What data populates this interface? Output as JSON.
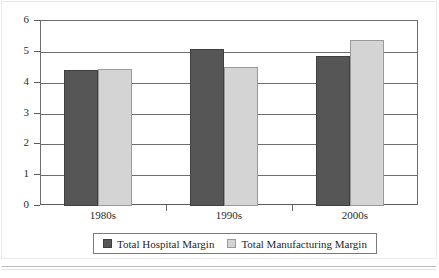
{
  "chart_data": {
    "type": "bar",
    "title": "",
    "subtitle": "",
    "xlabel": "",
    "ylabel": "",
    "categories": [
      "1980s",
      "1990s",
      "2000s"
    ],
    "series": [
      {
        "name": "Total Hospital Margin",
        "color": "#565656",
        "values": [
          4.4,
          5.1,
          4.85
        ]
      },
      {
        "name": "Total Manufacturing Margin",
        "color": "#d4d4d4",
        "values": [
          4.45,
          4.5,
          5.4
        ]
      }
    ],
    "ylim": [
      0,
      6
    ],
    "ytick_labels": [
      "0",
      "1",
      "2",
      "3",
      "4",
      "5",
      "6"
    ],
    "ytick_values": [
      0,
      1,
      2,
      3,
      4,
      5,
      6
    ],
    "grid": true,
    "grid_axis": "y",
    "legend_position": "bottom",
    "legend_entries": [
      "Total Hospital Margin",
      "Total Manufacturing Margin"
    ]
  },
  "axes": {
    "y": {
      "ticks": [
        {
          "label": "6",
          "value": 6
        },
        {
          "label": "5",
          "value": 5
        },
        {
          "label": "4",
          "value": 4
        },
        {
          "label": "3",
          "value": 3
        },
        {
          "label": "2",
          "value": 2
        },
        {
          "label": "1",
          "value": 1
        },
        {
          "label": "0",
          "value": 0
        }
      ]
    },
    "x": {
      "ticks": [
        {
          "label": "1980s"
        },
        {
          "label": "1990s"
        },
        {
          "label": "2000s"
        }
      ]
    }
  },
  "legend": {
    "items": [
      {
        "label": "Total Hospital Margin",
        "swatch": "dark-swatch-icon",
        "color": "#565656"
      },
      {
        "label": "Total Manufacturing Margin",
        "swatch": "light-swatch-icon",
        "color": "#d4d4d4"
      }
    ]
  },
  "colors": {
    "series_dark": "#565656",
    "series_light": "#d4d4d4",
    "axis": "#6d6d6d",
    "text": "#2b2b2b",
    "background": "#ffffff"
  }
}
